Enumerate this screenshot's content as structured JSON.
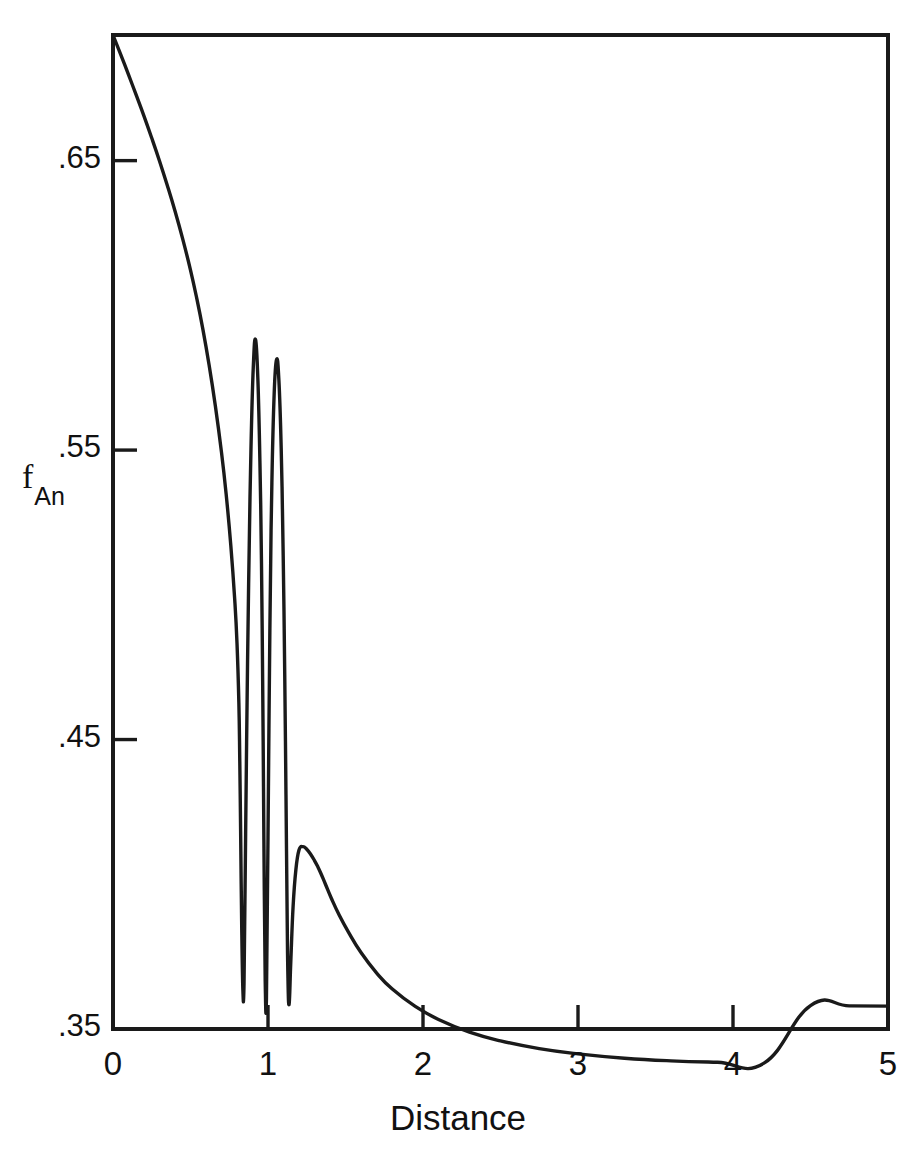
{
  "figure": {
    "background": "#ffffff",
    "line_color": "#1a1a1a",
    "axis_color": "#1a1a1a"
  },
  "labels": {
    "y_axis_main": "f",
    "y_axis_subscript": "An",
    "x_axis": "Distance"
  },
  "chart_data": {
    "type": "line",
    "title": "",
    "xlabel": "Distance",
    "ylabel": "f_An",
    "xlim": [
      0,
      5
    ],
    "ylim": [
      0.35,
      0.6934
    ],
    "grid": false,
    "legend": null,
    "xticks": [
      0,
      1,
      2,
      3,
      4,
      5
    ],
    "xtick_labels": [
      "0",
      "1",
      "2",
      "3",
      "4",
      "5"
    ],
    "yticks": [
      0.35,
      0.45,
      0.55,
      0.65
    ],
    "ytick_labels": [
      ".35",
      ".45",
      ".55",
      ".65"
    ],
    "series": [
      {
        "name": "f_An",
        "x": [
          0.0,
          0.05,
          0.1,
          0.15,
          0.2,
          0.25,
          0.3,
          0.35,
          0.4,
          0.45,
          0.5,
          0.54,
          0.58,
          0.62,
          0.66,
          0.7,
          0.73,
          0.76,
          0.785,
          0.8,
          0.812,
          0.818,
          0.824,
          0.83,
          0.838,
          0.845,
          0.852,
          0.862,
          0.875,
          0.89,
          0.905,
          0.92,
          0.935,
          0.948,
          0.958,
          0.966,
          0.971,
          0.976,
          0.982,
          0.99,
          1.0,
          1.012,
          1.025,
          1.04,
          1.055,
          1.07,
          1.085,
          1.098,
          1.108,
          1.116,
          1.122,
          1.128,
          1.136,
          1.147,
          1.162,
          1.18,
          1.2,
          1.225,
          1.25,
          1.275,
          1.3,
          1.32,
          1.34,
          1.37,
          1.41,
          1.46,
          1.52,
          1.6,
          1.7,
          1.8,
          1.95,
          2.1,
          2.3,
          2.5,
          2.75,
          3.0,
          3.3,
          3.6,
          3.9,
          4.2,
          4.5,
          4.75,
          5.0
        ],
        "y": [
          0.6934,
          0.6866,
          0.6797,
          0.6726,
          0.6654,
          0.6578,
          0.6499,
          0.6415,
          0.6326,
          0.6229,
          0.6122,
          0.6025,
          0.5917,
          0.5794,
          0.5654,
          0.5492,
          0.5348,
          0.5171,
          0.4986,
          0.4833,
          0.4627,
          0.4424,
          0.4153,
          0.3871,
          0.3634,
          0.3648,
          0.3982,
          0.4489,
          0.5038,
          0.5501,
          0.5786,
          0.5881,
          0.5739,
          0.5455,
          0.5107,
          0.4672,
          0.4337,
          0.3983,
          0.3665,
          0.3606,
          0.4161,
          0.4876,
          0.5386,
          0.5697,
          0.5812,
          0.5744,
          0.5508,
          0.5137,
          0.4723,
          0.4309,
          0.3976,
          0.3697,
          0.3585,
          0.3731,
          0.3924,
          0.4051,
          0.4118,
          0.413,
          0.4121,
          0.4104,
          0.4082,
          0.4062,
          0.4039,
          0.4001,
          0.395,
          0.3893,
          0.3834,
          0.3764,
          0.3694,
          0.3639,
          0.3578,
          0.3533,
          0.3489,
          0.3459,
          0.3432,
          0.3414,
          0.3399,
          0.339,
          0.3385,
          0.3382,
          0.3581,
          0.358,
          0.3579
        ]
      }
    ]
  }
}
